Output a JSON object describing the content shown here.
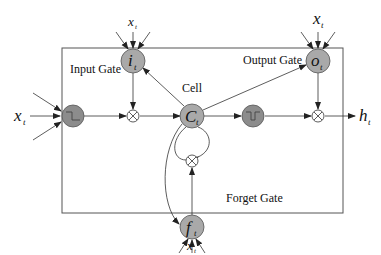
{
  "diagram": {
    "labels": {
      "input_gate": "Input Gate",
      "output_gate": "Output Gate",
      "forget_gate": "Forget Gate",
      "cell": "Cell"
    },
    "nodes": {
      "input": {
        "symbol": "x",
        "subscript": "t"
      },
      "output": {
        "symbol": "h",
        "subscript": "t"
      },
      "input_gate": {
        "symbol": "i",
        "subscript": "t"
      },
      "output_gate": {
        "symbol": "o",
        "subscript": "t"
      },
      "forget_gate": {
        "symbol": "f",
        "subscript": "t"
      },
      "cell_state": {
        "symbol": "C",
        "subscript": "t"
      },
      "input_gate_x": {
        "symbol": "x",
        "subscript": "t"
      },
      "output_gate_x": {
        "symbol": "x",
        "subscript": "t"
      },
      "forget_gate_x": {
        "symbol": "x",
        "subscript": "t"
      }
    },
    "colors": {
      "node_fill": "#a9a9a9",
      "activation_fill": "#8c8c8c",
      "stroke": "#333333",
      "box": "#555555"
    }
  }
}
